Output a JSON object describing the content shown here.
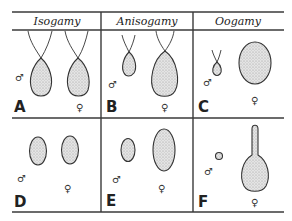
{
  "diagram": {
    "headers": [
      "Isogamy",
      "Anisogamy",
      "Oogamy"
    ],
    "panels": [
      {
        "letter": "A",
        "type": "isogamy-flagellated",
        "male_symbol": "♂",
        "female_symbol": "♀"
      },
      {
        "letter": "B",
        "type": "anisogamy-flagellated",
        "male_symbol": "♂",
        "female_symbol": "♀"
      },
      {
        "letter": "C",
        "type": "oogamy-flagellated-sperm",
        "male_symbol": "♂",
        "female_symbol": "♀"
      },
      {
        "letter": "D",
        "type": "isogamy-nonflagellated",
        "male_symbol": "♂",
        "female_symbol": "♀"
      },
      {
        "letter": "E",
        "type": "anisogamy-nonflagellated",
        "male_symbol": "♂",
        "female_symbol": "♀"
      },
      {
        "letter": "F",
        "type": "oogamy-nonflagellated",
        "male_symbol": "♂",
        "female_symbol": "♀"
      }
    ],
    "colors": {
      "line": "#3a3a3a",
      "cell_fill": "#d9d9d9",
      "background": "#ffffff"
    }
  }
}
